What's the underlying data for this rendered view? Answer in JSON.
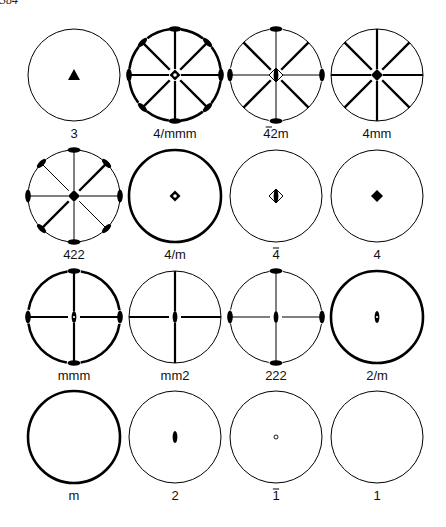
{
  "page": {
    "number_fragment": "384"
  },
  "figure": {
    "ink_color": "#000000",
    "paper_color": "#ffffff",
    "radius": 46,
    "columns_x": [
      74,
      175,
      276,
      377
    ],
    "rows_y": [
      75,
      196,
      317,
      437
    ],
    "label_offsets_y": 63,
    "groups": [
      {
        "row": 0,
        "col": 0,
        "label": "3",
        "bar": null,
        "circle": "thin",
        "dashed": false,
        "center": "triangle",
        "lines": [],
        "diag_thick": [],
        "diag_thin": [],
        "ends": [],
        "diag_ends": []
      },
      {
        "row": 0,
        "col": 1,
        "label": "4/mmm",
        "bar": null,
        "circle": "thick",
        "dashed": true,
        "center": "diamond-open-dot",
        "lines": [
          "h-thick",
          "v-thick"
        ],
        "diag_thick": [
          "d1",
          "d2"
        ],
        "diag_thin": [],
        "ends": [
          "top",
          "bottom",
          "left",
          "right"
        ],
        "diag_ends": [
          "tl",
          "tr",
          "bl",
          "br"
        ]
      },
      {
        "row": 0,
        "col": 2,
        "label": "42m",
        "bar": "4",
        "circle": "thin",
        "dashed": true,
        "center": "diamond-half",
        "lines": [
          "h-thin",
          "v-thin"
        ],
        "diag_thick": [
          "d1",
          "d2"
        ],
        "diag_thin": [],
        "ends": [
          "top",
          "bottom",
          "left",
          "right"
        ],
        "diag_ends": []
      },
      {
        "row": 0,
        "col": 3,
        "label": "4mm",
        "bar": null,
        "circle": "thin",
        "dashed": false,
        "center": "diamond-solid",
        "lines": [
          "h-thick",
          "v-thick"
        ],
        "diag_thick": [
          "d1",
          "d2"
        ],
        "diag_thin": [],
        "ends": [],
        "diag_ends": []
      },
      {
        "row": 1,
        "col": 0,
        "label": "422",
        "bar": null,
        "circle": "thin",
        "dashed": true,
        "center": "diamond-solid",
        "lines": [
          "h-thin",
          "v-thin"
        ],
        "diag_thick": [
          "d2"
        ],
        "diag_thin": [
          "d1"
        ],
        "ends": [
          "top",
          "bottom",
          "left",
          "right"
        ],
        "diag_ends": [
          "tl",
          "tr",
          "bl",
          "br"
        ]
      },
      {
        "row": 1,
        "col": 1,
        "label": "4/m",
        "bar": null,
        "circle": "thick",
        "dashed": false,
        "center": "diamond-open-dot",
        "lines": [],
        "diag_thick": [],
        "diag_thin": [],
        "ends": [],
        "diag_ends": []
      },
      {
        "row": 1,
        "col": 2,
        "label": "4",
        "bar": "4",
        "circle": "thin",
        "dashed": false,
        "center": "diamond-half",
        "lines": [],
        "diag_thick": [],
        "diag_thin": [],
        "ends": [],
        "diag_ends": []
      },
      {
        "row": 1,
        "col": 3,
        "label": "4",
        "bar": null,
        "circle": "thin",
        "dashed": false,
        "center": "diamond-solid",
        "lines": [],
        "diag_thick": [],
        "diag_thin": [],
        "ends": [],
        "diag_ends": []
      },
      {
        "row": 2,
        "col": 0,
        "label": "mmm",
        "bar": null,
        "circle": "thick",
        "dashed": true,
        "center": "ellipse-open-dot",
        "lines": [
          "h-thick",
          "v-thick"
        ],
        "diag_thick": [],
        "diag_thin": [],
        "ends": [
          "top",
          "bottom",
          "left",
          "right"
        ],
        "diag_ends": []
      },
      {
        "row": 2,
        "col": 1,
        "label": "mm2",
        "bar": null,
        "circle": "thin",
        "dashed": false,
        "center": "ellipse-solid",
        "lines": [
          "h-thick",
          "v-thick"
        ],
        "diag_thick": [],
        "diag_thin": [],
        "ends": [],
        "diag_ends": []
      },
      {
        "row": 2,
        "col": 2,
        "label": "222",
        "bar": null,
        "circle": "thin",
        "dashed": true,
        "center": "ellipse-solid",
        "lines": [
          "h-thin",
          "v-thin"
        ],
        "diag_thick": [],
        "diag_thin": [],
        "ends": [
          "top",
          "bottom",
          "left",
          "right"
        ],
        "diag_ends": []
      },
      {
        "row": 2,
        "col": 3,
        "label": "2/m",
        "bar": null,
        "circle": "thick",
        "dashed": false,
        "center": "ellipse-open-dot",
        "lines": [],
        "diag_thick": [],
        "diag_thin": [],
        "ends": [],
        "diag_ends": []
      },
      {
        "row": 3,
        "col": 0,
        "label": "m",
        "bar": null,
        "circle": "thick",
        "dashed": false,
        "center": null,
        "lines": [],
        "diag_thick": [],
        "diag_thin": [],
        "ends": [],
        "diag_ends": []
      },
      {
        "row": 3,
        "col": 1,
        "label": "2",
        "bar": null,
        "circle": "thin",
        "dashed": false,
        "center": "ellipse-solid",
        "lines": [],
        "diag_thick": [],
        "diag_thin": [],
        "ends": [],
        "diag_ends": []
      },
      {
        "row": 3,
        "col": 2,
        "label": "1",
        "bar": "1",
        "circle": "thin",
        "dashed": false,
        "center": "small-circle",
        "lines": [],
        "diag_thick": [],
        "diag_thin": [],
        "ends": [],
        "diag_ends": []
      },
      {
        "row": 3,
        "col": 3,
        "label": "1",
        "bar": null,
        "circle": "thin",
        "dashed": false,
        "center": null,
        "lines": [],
        "diag_thick": [],
        "diag_thin": [],
        "ends": [],
        "diag_ends": []
      }
    ]
  }
}
